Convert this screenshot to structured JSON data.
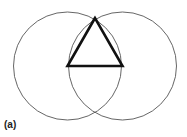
{
  "figure": {
    "label": "(a)",
    "stroke_color": "#555555",
    "triangle_color": "#111111",
    "circles": [
      {
        "name": "left-circle",
        "cx": 67.5,
        "cy": 66,
        "r": 54
      },
      {
        "name": "right-circle",
        "cx": 122.5,
        "cy": 66,
        "r": 54
      }
    ],
    "triangle": {
      "points": [
        [
          95,
          18
        ],
        [
          67.5,
          66
        ],
        [
          122.5,
          66
        ]
      ]
    }
  }
}
